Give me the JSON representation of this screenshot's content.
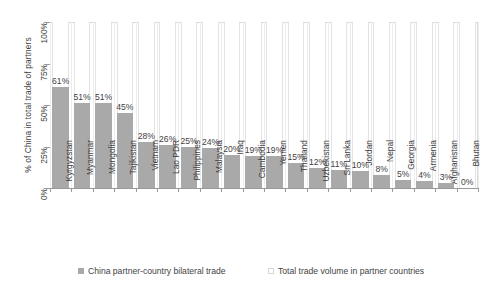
{
  "chart_data": {
    "type": "bar",
    "title": "",
    "subtitle": "",
    "xlabel": "",
    "ylabel": "% of China in total trade of partners",
    "ylim": [
      0,
      100
    ],
    "y_ticks": [
      "0%",
      "25%",
      "50%",
      "75%",
      "100%"
    ],
    "y_tick_values": [
      0,
      25,
      50,
      75,
      100
    ],
    "grid": "vertical",
    "legend_position": "bottom",
    "categories": [
      "Kyrgyzstan",
      "Myanmar",
      "Mongolia",
      "Tajikistan",
      "Vietnam",
      "Lao PDR",
      "Philippines",
      "Malaysia",
      "Iraq",
      "Cambodia",
      "Yemen",
      "Thailand",
      "Uzbekistan",
      "Sri Lanka",
      "Jordan",
      "Nepal",
      "Georgia",
      "Armenia",
      "Afghanistan",
      "Bhutan"
    ],
    "values": [
      61,
      51,
      51,
      45,
      28,
      26,
      25,
      24,
      20,
      19,
      19,
      15,
      12,
      11,
      10,
      8,
      5,
      4,
      3,
      0
    ],
    "data_labels": [
      "61%",
      "51%",
      "51%",
      "45%",
      "28%",
      "26%",
      "25%",
      "24%",
      "20%",
      "19%",
      "19%",
      "15%",
      "12%",
      "11%",
      "10%",
      "8%",
      "5%",
      "4%",
      "3%",
      "0%"
    ],
    "series": [
      {
        "name": "China partner-country bilateral trade",
        "color": "#a9a9a9",
        "values": [
          61,
          51,
          51,
          45,
          28,
          26,
          25,
          24,
          20,
          19,
          19,
          15,
          12,
          11,
          10,
          8,
          5,
          4,
          3,
          0
        ]
      },
      {
        "name": "Total trade volume in partner countries",
        "color": "#ffffff",
        "values": [
          100,
          100,
          100,
          100,
          100,
          100,
          100,
          100,
          100,
          100,
          100,
          100,
          100,
          100,
          100,
          100,
          100,
          100,
          100,
          100
        ]
      }
    ]
  },
  "legend": {
    "items": [
      {
        "label": "China partner-country bilateral trade",
        "swatch": "filled"
      },
      {
        "label": "Total trade volume in partner countries",
        "swatch": "hollow"
      }
    ]
  },
  "colors": {
    "bar_fill": "#a9a9a9",
    "bar_total": "#ffffff",
    "axis": "#9a9a9a",
    "gridline": "#ededed",
    "text": "#3f3f3f",
    "background": "#ffffff"
  }
}
